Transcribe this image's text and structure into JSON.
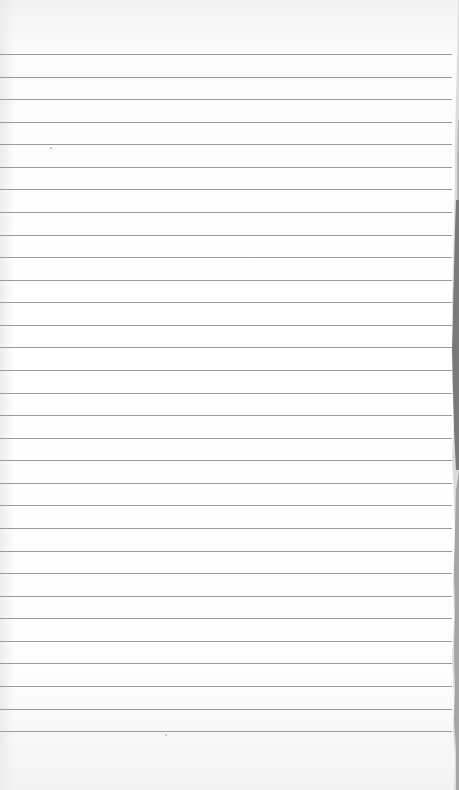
{
  "paper": {
    "type": "lined-notebook-page",
    "background_color": "#ffffff",
    "line_color": "#9c9c9c",
    "line_count": 31,
    "first_line_y": 54,
    "line_spacing": 22.57,
    "torn_right_edge": true,
    "edge_shadow_color": "#6e6e6e"
  }
}
